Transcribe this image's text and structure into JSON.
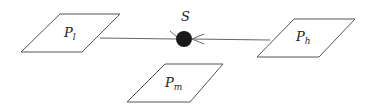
{
  "diagram": {
    "center_node": {
      "label": "S",
      "color": "#1a1a1a"
    },
    "nodes": [
      {
        "id": "pl",
        "base": "P",
        "sub": "l"
      },
      {
        "id": "ph",
        "base": "P",
        "sub": "h"
      },
      {
        "id": "pm",
        "base": "P",
        "sub": "m"
      }
    ],
    "edges": [
      {
        "from": "pl",
        "to": "S"
      },
      {
        "from": "ph",
        "to": "S",
        "arrow": "open"
      }
    ]
  }
}
